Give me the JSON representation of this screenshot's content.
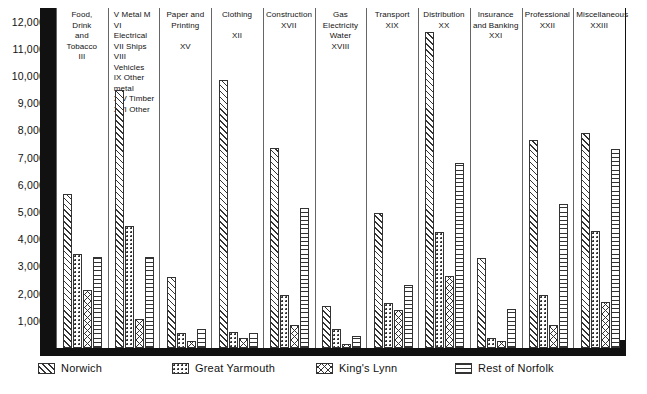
{
  "chart_data": {
    "type": "bar",
    "title": "",
    "xlabel": "",
    "ylabel": "",
    "ylim": [
      0,
      12500
    ],
    "grid": false,
    "legend_position": "bottom",
    "y_ticks": [
      1000,
      2000,
      3000,
      4000,
      5000,
      6000,
      7000,
      8000,
      9000,
      10000,
      11000,
      12000
    ],
    "y_tick_labels": [
      "1,000",
      "2,000",
      "3,000",
      "4,000",
      "5,000",
      "6,000",
      "7,000",
      "8,000",
      "9,000",
      "10,000",
      "11,000",
      "12,000"
    ],
    "series": [
      {
        "name": "Norwich",
        "pattern": "diagonal-hatch",
        "values": [
          5650,
          9500,
          2600,
          9850,
          7350,
          1550,
          4950,
          11600,
          3300,
          7650,
          7900
        ]
      },
      {
        "name": "Great Yarmouth",
        "pattern": "dots",
        "values": [
          3450,
          4500,
          550,
          600,
          1950,
          700,
          1650,
          4250,
          350,
          1950,
          4300
        ]
      },
      {
        "name": "King's Lynn",
        "pattern": "cross-hatch",
        "values": [
          2150,
          1050,
          250,
          350,
          850,
          150,
          1400,
          2650,
          250,
          850,
          1700
        ]
      },
      {
        "name": "Rest of Norfolk",
        "pattern": "horizontal-lines",
        "values": [
          3350,
          3350,
          700,
          550,
          5150,
          450,
          2300,
          6800,
          1450,
          5300,
          7300
        ]
      }
    ],
    "categories": [
      {
        "label": "Food, Drink and Tobacco",
        "code": "III"
      },
      {
        "label": "V Metal M\nVI Electrical\nVII Ships\nVIII Vehicles\nIX Other metal\nXIV Timber\nXVI Other",
        "code": ""
      },
      {
        "label": "Paper and Printing",
        "code": "XV"
      },
      {
        "label": "Clothing",
        "code": "XII"
      },
      {
        "label": "Construction",
        "code": "XVII"
      },
      {
        "label": "Gas Electricity Water",
        "code": "XVIII"
      },
      {
        "label": "Transport",
        "code": "XIX"
      },
      {
        "label": "Distribution",
        "code": "XX"
      },
      {
        "label": "Insurance and Banking",
        "code": "XXI"
      },
      {
        "label": "Professional",
        "code": "XXII"
      },
      {
        "label": "Miscellaneous",
        "code": "XXIII"
      }
    ]
  },
  "axis": {
    "ticks": [
      {
        "value": 12000,
        "label": "12,000"
      },
      {
        "value": 11000,
        "label": "11,000"
      },
      {
        "value": 10000,
        "label": "10,000"
      },
      {
        "value": 9000,
        "label": "9,000"
      },
      {
        "value": 8000,
        "label": "8,000"
      },
      {
        "value": 7000,
        "label": "7,000"
      },
      {
        "value": 6000,
        "label": "6,000"
      },
      {
        "value": 5000,
        "label": "5,000"
      },
      {
        "value": 4000,
        "label": "4,000"
      },
      {
        "value": 3000,
        "label": "3,000"
      },
      {
        "value": 2000,
        "label": "2,000"
      },
      {
        "value": 1000,
        "label": "1,000"
      }
    ]
  },
  "groups": [
    {
      "id": "food-drink-tobacco",
      "header_lines": [
        "Food,",
        "Drink",
        "and",
        "Tobacco",
        "III"
      ],
      "align": "center",
      "values": {
        "norwich": 5650,
        "yarmouth": 3450,
        "lynn": 2150,
        "norfolk": 3350
      }
    },
    {
      "id": "metal-electrical-ships-vehicles",
      "header_lines": [
        "V  Metal M",
        "VI  Electrical",
        "VII  Ships",
        "VIII  Vehicles",
        "IX  Other metal",
        "XIV  Timber",
        "XVI  Other"
      ],
      "align": "left",
      "values": {
        "norwich": 9500,
        "yarmouth": 4500,
        "lynn": 1050,
        "norfolk": 3350
      }
    },
    {
      "id": "paper-and-printing",
      "header_lines": [
        "Paper and",
        "Printing",
        "",
        "XV"
      ],
      "align": "center",
      "values": {
        "norwich": 2600,
        "yarmouth": 550,
        "lynn": 250,
        "norfolk": 700
      }
    },
    {
      "id": "clothing",
      "header_lines": [
        "Clothing",
        "",
        "XII"
      ],
      "align": "center",
      "values": {
        "norwich": 9850,
        "yarmouth": 600,
        "lynn": 350,
        "norfolk": 550
      }
    },
    {
      "id": "construction",
      "header_lines": [
        "Construction",
        "XVII"
      ],
      "align": "center",
      "values": {
        "norwich": 7350,
        "yarmouth": 1950,
        "lynn": 850,
        "norfolk": 5150
      }
    },
    {
      "id": "gas-electricity-water",
      "header_lines": [
        "Gas",
        "Electricity",
        "Water",
        "XVIII"
      ],
      "align": "center",
      "values": {
        "norwich": 1550,
        "yarmouth": 700,
        "lynn": 150,
        "norfolk": 450
      }
    },
    {
      "id": "transport",
      "header_lines": [
        "Transport",
        "XIX"
      ],
      "align": "center",
      "values": {
        "norwich": 4950,
        "yarmouth": 1650,
        "lynn": 1400,
        "norfolk": 2300
      }
    },
    {
      "id": "distribution",
      "header_lines": [
        "Distribution",
        "XX"
      ],
      "align": "center",
      "values": {
        "norwich": 11600,
        "yarmouth": 4250,
        "lynn": 2650,
        "norfolk": 6800
      }
    },
    {
      "id": "insurance-and-banking",
      "header_lines": [
        "Insurance",
        "and Banking",
        "XXI"
      ],
      "align": "center",
      "values": {
        "norwich": 3300,
        "yarmouth": 350,
        "lynn": 250,
        "norfolk": 1450
      }
    },
    {
      "id": "professional",
      "header_lines": [
        "Professional",
        "XXII"
      ],
      "align": "center",
      "values": {
        "norwich": 7650,
        "yarmouth": 1950,
        "lynn": 850,
        "norfolk": 5300
      }
    },
    {
      "id": "miscellaneous",
      "header_lines": [
        "Miscellaneous",
        "XXIII"
      ],
      "align": "center",
      "values": {
        "norwich": 7900,
        "yarmouth": 4300,
        "lynn": 1700,
        "norfolk": 7300
      }
    }
  ],
  "legend": {
    "items": [
      {
        "id": "norwich",
        "label": "Norwich",
        "pattern": "diagonal-hatch"
      },
      {
        "id": "great-yarmouth",
        "label": "Great Yarmouth",
        "pattern": "dots"
      },
      {
        "id": "kings-lynn",
        "label": "King's Lynn",
        "pattern": "cross-hatch"
      },
      {
        "id": "rest-of-norfolk",
        "label": "Rest of Norfolk",
        "pattern": "horizontal-lines"
      }
    ]
  },
  "colors": {
    "ink": "#111111",
    "rule": "#666666",
    "paper": "#ffffff"
  }
}
